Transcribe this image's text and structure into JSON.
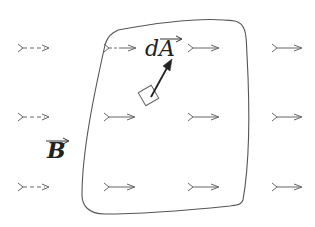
{
  "diagram": {
    "type": "magnetic-flux-surface",
    "labels": {
      "area_element": "dA",
      "field": "B"
    },
    "vector_overbars": [
      "dA",
      "B"
    ],
    "colors": {
      "field_arrow": "#666666",
      "surface_outline": "#555555",
      "area_vector": "#222222",
      "text": "#222222",
      "background": "#ffffff"
    },
    "field_arrows": {
      "rows_y": [
        48,
        117,
        187
      ],
      "columns": [
        {
          "x_start": 18,
          "x_end": 50,
          "style": "dashed"
        },
        {
          "x_start": 104,
          "x_end": 136,
          "style": "solid"
        },
        {
          "x_start": 188,
          "x_end": 219,
          "style": "solid"
        },
        {
          "x_start": 272,
          "x_end": 302,
          "style": "solid"
        }
      ]
    }
  }
}
